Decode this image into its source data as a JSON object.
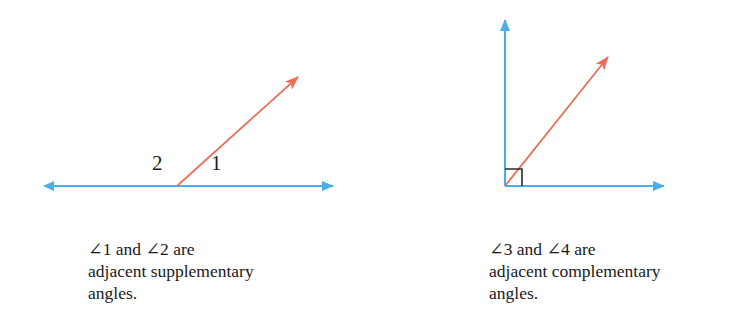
{
  "page": {
    "width": 735,
    "height": 336,
    "background": "#ffffff"
  },
  "colors": {
    "ray_red": "#e8705a",
    "line_blue": "#4baee8",
    "label_text": "#1c1c1c",
    "caption_text": "#1a1a1a",
    "right_angle_marker": "#2b2b2b"
  },
  "figures": [
    {
      "id": "supplementary",
      "name": "adjacent-supplementary-angles-figure",
      "vertex": {
        "x": 177,
        "y": 186
      },
      "elements": {
        "baseline": {
          "name": "horizontal-double-arrow-line",
          "from": {
            "x": 42,
            "y": 186
          },
          "to": {
            "x": 345,
            "y": 186
          },
          "arrowheads": "both",
          "color": "#4baee8"
        },
        "ray": {
          "name": "red-ray",
          "from": {
            "x": 177,
            "y": 186
          },
          "to": {
            "x": 308,
            "y": 68
          },
          "arrowheads": "end",
          "color": "#e8705a"
        }
      },
      "labels": [
        {
          "name": "angle-label-2",
          "text": "2",
          "x": 152,
          "y": 153
        },
        {
          "name": "angle-label-1",
          "text": "1",
          "x": 211,
          "y": 153
        }
      ],
      "caption": {
        "name": "caption-supplementary",
        "x": 88,
        "y": 238,
        "lines": [
          "∠1 and ∠2 are",
          "adjacent supplementary",
          "angles."
        ]
      }
    },
    {
      "id": "complementary",
      "name": "adjacent-complementary-angles-figure",
      "vertex": {
        "x": 505,
        "y": 186
      },
      "elements": {
        "vertical_axis": {
          "name": "vertical-arrow-line",
          "from": {
            "x": 505,
            "y": 186
          },
          "to": {
            "x": 505,
            "y": 8
          },
          "arrowheads": "end",
          "color": "#4baee8"
        },
        "horizontal_axis": {
          "name": "horizontal-arrow-line",
          "from": {
            "x": 505,
            "y": 186
          },
          "to": {
            "x": 676,
            "y": 186
          },
          "arrowheads": "end",
          "color": "#4baee8"
        },
        "ray": {
          "name": "red-ray",
          "from": {
            "x": 505,
            "y": 186
          },
          "to": {
            "x": 617,
            "y": 46
          },
          "arrowheads": "end",
          "color": "#e8705a"
        },
        "right_angle_marker": {
          "name": "right-angle-square-marker",
          "corner": {
            "x": 505,
            "y": 186
          },
          "size": 17,
          "color": "#2b2b2b"
        }
      },
      "labels": [
        {
          "name": "angle-label-4",
          "text": "4",
          "x": 508,
          "y": 139
        },
        {
          "name": "angle-label-3",
          "text": "3",
          "x": 531,
          "y": 157
        }
      ],
      "caption": {
        "name": "caption-complementary",
        "x": 489,
        "y": 238,
        "lines": [
          "∠3 and ∠4 are",
          "adjacent complementary",
          "angles."
        ]
      }
    }
  ]
}
